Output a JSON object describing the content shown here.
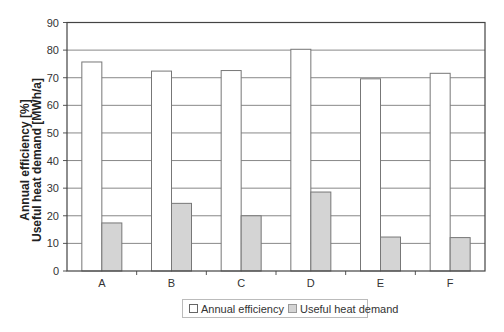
{
  "chart_data": {
    "type": "bar",
    "title": "",
    "xlabel": "",
    "ylabel": "Annual efficiency [%]\nUseful heat demand [MWh/a]",
    "ylabel_lines": [
      "Annual efficiency [%]",
      "Useful heat demand [MWh/a]"
    ],
    "categories": [
      "A",
      "B",
      "C",
      "D",
      "E",
      "F"
    ],
    "series": [
      {
        "name": "Annual efficiency",
        "color": "#ffffff",
        "values": [
          75.7,
          72.4,
          72.6,
          80.3,
          69.6,
          71.6
        ]
      },
      {
        "name": "Useful heat demand",
        "color": "#d4d4d4",
        "values": [
          17.4,
          24.5,
          20.0,
          28.6,
          12.3,
          12.1
        ]
      }
    ],
    "ylim": [
      0,
      90
    ],
    "yticks": [
      0,
      10,
      20,
      30,
      40,
      50,
      60,
      70,
      80,
      90
    ],
    "grid": true,
    "legend_position": "bottom"
  },
  "legend": {
    "items": [
      {
        "label": "Annual efficiency",
        "color": "#ffffff"
      },
      {
        "label": "Useful heat demand",
        "color": "#d4d4d4"
      }
    ]
  }
}
